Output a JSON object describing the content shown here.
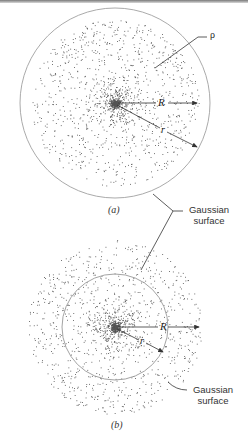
{
  "figure": {
    "panel_a": {
      "caption": "(a)",
      "density_label": "ρ",
      "radius_label_big": "R",
      "radius_label_small": "r",
      "gaussian_label_line1": "Gaussian",
      "gaussian_label_line2": "surface"
    },
    "panel_b": {
      "caption": "(b)",
      "radius_label_big": "R",
      "radius_label_small": "r",
      "gaussian_label_line1": "Gaussian",
      "gaussian_label_line2": "surface"
    }
  },
  "colors": {
    "dots": "#555555",
    "circle": "#9a9a9a",
    "lines": "#333333",
    "background": "#ffffff"
  }
}
